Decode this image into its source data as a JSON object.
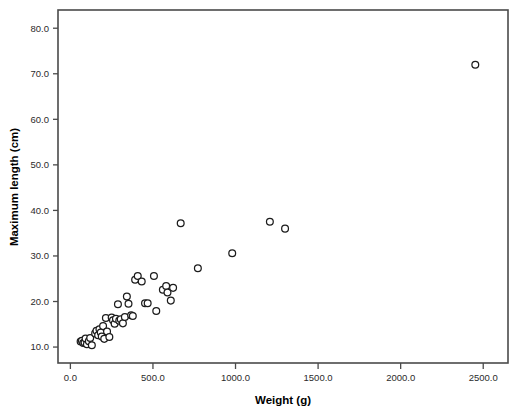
{
  "chart_data": {
    "type": "scatter",
    "title": "",
    "xlabel": "Weight (g)",
    "ylabel": "Maximum length (cm)",
    "xlim": [
      -75,
      2650
    ],
    "ylim": [
      6.5,
      84
    ],
    "grid": false,
    "legend": null,
    "xticks": [
      0,
      500,
      1000,
      1500,
      2000,
      2500
    ],
    "xtick_labels": [
      "0.0",
      "500.0",
      "1000.0",
      "1500.0",
      "2000.0",
      "2500.0"
    ],
    "yticks": [
      10,
      20,
      30,
      40,
      50,
      60,
      70,
      80
    ],
    "ytick_labels": [
      "10.0",
      "20.0",
      "30.0",
      "40.0",
      "50.0",
      "60.0",
      "70.0",
      "80.0"
    ],
    "marker": "open-circle",
    "marker_color": "#1c1c1c",
    "marker_fill": "#ffffff",
    "points": [
      {
        "x": 62,
        "y": 11.2
      },
      {
        "x": 70,
        "y": 11.4
      },
      {
        "x": 78,
        "y": 10.9
      },
      {
        "x": 86,
        "y": 11.0
      },
      {
        "x": 92,
        "y": 11.9
      },
      {
        "x": 100,
        "y": 10.6
      },
      {
        "x": 112,
        "y": 11.3
      },
      {
        "x": 120,
        "y": 12.0
      },
      {
        "x": 130,
        "y": 10.4
      },
      {
        "x": 150,
        "y": 13.0
      },
      {
        "x": 158,
        "y": 13.6
      },
      {
        "x": 168,
        "y": 12.6
      },
      {
        "x": 176,
        "y": 13.9
      },
      {
        "x": 184,
        "y": 13.2
      },
      {
        "x": 190,
        "y": 12.3
      },
      {
        "x": 198,
        "y": 14.6
      },
      {
        "x": 205,
        "y": 11.8
      },
      {
        "x": 215,
        "y": 16.4
      },
      {
        "x": 222,
        "y": 13.4
      },
      {
        "x": 236,
        "y": 12.2
      },
      {
        "x": 250,
        "y": 16.5
      },
      {
        "x": 258,
        "y": 15.9
      },
      {
        "x": 268,
        "y": 15.1
      },
      {
        "x": 276,
        "y": 16.2
      },
      {
        "x": 288,
        "y": 19.4
      },
      {
        "x": 296,
        "y": 15.8
      },
      {
        "x": 305,
        "y": 16.1
      },
      {
        "x": 318,
        "y": 15.2
      },
      {
        "x": 330,
        "y": 16.6
      },
      {
        "x": 342,
        "y": 21.1
      },
      {
        "x": 352,
        "y": 19.5
      },
      {
        "x": 368,
        "y": 17.0
      },
      {
        "x": 378,
        "y": 16.8
      },
      {
        "x": 392,
        "y": 24.8
      },
      {
        "x": 408,
        "y": 25.6
      },
      {
        "x": 432,
        "y": 24.4
      },
      {
        "x": 452,
        "y": 19.6
      },
      {
        "x": 468,
        "y": 19.6
      },
      {
        "x": 506,
        "y": 25.6
      },
      {
        "x": 520,
        "y": 17.9
      },
      {
        "x": 560,
        "y": 22.6
      },
      {
        "x": 580,
        "y": 23.4
      },
      {
        "x": 588,
        "y": 22.0
      },
      {
        "x": 608,
        "y": 20.2
      },
      {
        "x": 622,
        "y": 23.0
      },
      {
        "x": 668,
        "y": 37.2
      },
      {
        "x": 772,
        "y": 27.3
      },
      {
        "x": 980,
        "y": 30.6
      },
      {
        "x": 1208,
        "y": 37.5
      },
      {
        "x": 1300,
        "y": 36.0
      },
      {
        "x": 2452,
        "y": 72.0
      }
    ]
  },
  "figure": {
    "background": "#ffffff",
    "frame_color": "#4a4a4a"
  }
}
